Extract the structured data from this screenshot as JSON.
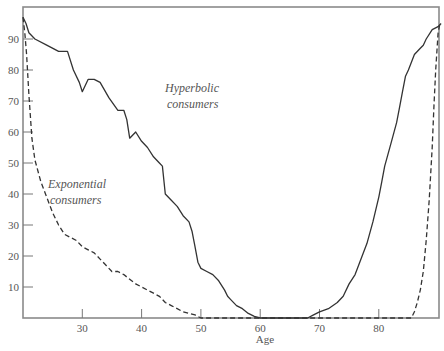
{
  "chart_data": {
    "type": "line",
    "title": "",
    "xlabel": "Age",
    "ylabel": "",
    "xlim": [
      20,
      90.5
    ],
    "ylim": [
      0,
      100
    ],
    "x_ticks": [
      30,
      40,
      50,
      60,
      70,
      80
    ],
    "y_ticks": [
      10,
      20,
      30,
      40,
      50,
      60,
      70,
      80,
      90
    ],
    "grid": false,
    "legend": null,
    "annotations": [
      {
        "text_line1": "Hyperbolic",
        "text_line2": "consumers",
        "x": 43,
        "y": 77
      },
      {
        "text_line1": "Exponential",
        "text_line2": "consumers",
        "x": 24.5,
        "y": 42
      }
    ],
    "series": [
      {
        "name": "Hyperbolic consumers",
        "style": "solid",
        "x": [
          20,
          20.5,
          21,
          22,
          24,
          26,
          27.5,
          28.5,
          29.5,
          30,
          31,
          32,
          33,
          34.5,
          36,
          37,
          37.5,
          38,
          39,
          40,
          41,
          42,
          43,
          43.5,
          44,
          45,
          46,
          47,
          48,
          48.5,
          49,
          49.5,
          50,
          51,
          52,
          53,
          54,
          54.5,
          55,
          56,
          57,
          58,
          59,
          60,
          68,
          69,
          70,
          71.5,
          73,
          74,
          75,
          76,
          77,
          78,
          79,
          80,
          80.5,
          81,
          82,
          83,
          83.5,
          84,
          84.5,
          85,
          86,
          87,
          87.5,
          88,
          89,
          90,
          90.5
        ],
        "y": [
          97,
          95,
          92,
          90,
          88,
          86,
          86,
          80,
          76,
          73,
          77,
          77,
          76,
          71,
          67,
          67,
          64,
          58,
          60,
          57,
          55,
          52,
          50,
          49,
          40,
          38,
          36,
          33,
          31,
          28,
          23,
          18,
          16,
          15,
          14,
          12,
          9,
          7,
          6,
          4,
          3,
          1.5,
          0.5,
          0,
          0,
          1,
          2,
          3,
          5,
          7,
          11,
          14,
          19,
          24,
          31,
          39,
          44,
          49,
          56,
          63,
          68,
          73,
          78,
          80,
          85,
          87,
          88,
          90,
          93,
          94,
          95
        ]
      },
      {
        "name": "Exponential consumers",
        "style": "dashed",
        "x": [
          20,
          20.3,
          20.6,
          21,
          21.5,
          22,
          23,
          24,
          25,
          26,
          27,
          28,
          29,
          30,
          31,
          32,
          33,
          34,
          35,
          36,
          37,
          38,
          39,
          40,
          41,
          42,
          43,
          44,
          45,
          46,
          47,
          48,
          49,
          50,
          85.5,
          86,
          86.5,
          87,
          87.5,
          88,
          88.5,
          89,
          89.3,
          89.6,
          90,
          90.3
        ],
        "y": [
          97,
          92,
          85,
          72,
          58,
          51,
          44,
          39,
          34,
          30,
          27,
          26,
          25,
          23,
          22,
          21,
          19,
          17,
          15,
          15,
          14,
          12.5,
          11,
          10,
          9,
          8,
          7,
          5,
          4,
          3,
          2,
          1.5,
          1,
          0,
          0,
          2,
          5,
          9,
          15,
          25,
          38,
          55,
          68,
          80,
          92,
          95
        ]
      }
    ]
  }
}
